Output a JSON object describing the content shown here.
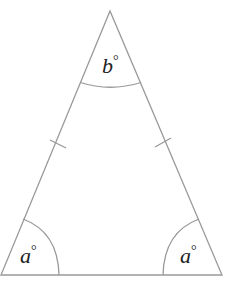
{
  "diagram": {
    "type": "isosceles-triangle",
    "angles": {
      "apex": {
        "variable": "b",
        "unit": "°"
      },
      "bottom_left": {
        "variable": "a",
        "unit": "°"
      },
      "bottom_right": {
        "variable": "a",
        "unit": "°"
      }
    },
    "equal_sides_marked": [
      "left",
      "right"
    ],
    "stroke_color": "#999999",
    "label_color": "#222222"
  }
}
